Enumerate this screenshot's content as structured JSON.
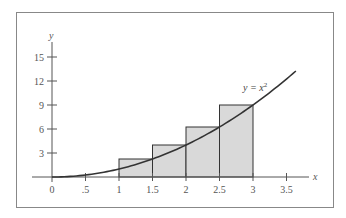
{
  "chart_data": {
    "type": "bar",
    "subtype": "riemann-sum-with-curve",
    "title": "",
    "xlabel": "x",
    "ylabel": "y",
    "xlim": [
      0,
      3.7
    ],
    "ylim": [
      0,
      16.5
    ],
    "grid": false,
    "x_ticks": [
      0,
      0.5,
      1,
      1.5,
      2,
      2.5,
      3,
      3.5
    ],
    "x_tick_labels": [
      "0",
      ".5",
      "1",
      "1.5",
      "2",
      "2.5",
      "3",
      "3.5"
    ],
    "y_ticks": [
      3,
      6,
      9,
      12,
      15
    ],
    "y_tick_labels": [
      "3",
      "6",
      "9",
      "12",
      "15"
    ],
    "curve": {
      "label": "y = x",
      "label_superscript": "2",
      "function": "x^2",
      "x_range": [
        0,
        3.64
      ]
    },
    "rectangles": [
      {
        "x0": 1,
        "x1": 1.5,
        "height": 2.25
      },
      {
        "x0": 1.5,
        "x1": 2,
        "height": 4
      },
      {
        "x0": 2,
        "x1": 2.5,
        "height": 6.25
      },
      {
        "x0": 2.5,
        "x1": 3,
        "height": 9
      }
    ],
    "colors": {
      "rect_fill": "#d9d9d9",
      "line": "#333333",
      "axis": "#555555",
      "frame": "#888888"
    }
  }
}
